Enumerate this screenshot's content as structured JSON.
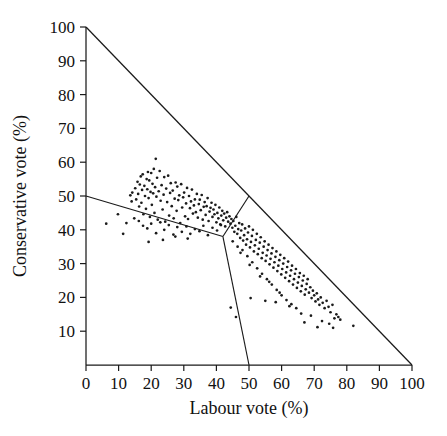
{
  "figure": {
    "background": "#ffffff",
    "ink_color": "#1a1a1a"
  },
  "chart_data": {
    "type": "scatter",
    "title": "",
    "subtitle": "",
    "xlabel": "Labour vote (%)",
    "ylabel": "Conservative vote (%)",
    "xlim": [
      0,
      100
    ],
    "ylim": [
      0,
      100
    ],
    "grid": false,
    "legend": null,
    "xticks": [
      0,
      10,
      20,
      30,
      40,
      50,
      60,
      70,
      80,
      90,
      100
    ],
    "xticklabels": [
      "0",
      "10",
      "20",
      "30",
      "40",
      "50",
      "60",
      "70",
      "80",
      "90",
      "100"
    ],
    "yticks": [
      10,
      20,
      30,
      40,
      50,
      60,
      70,
      80,
      90,
      100
    ],
    "yticklabels": [
      "10",
      "20",
      "30",
      "40",
      "50",
      "60",
      "70",
      "80",
      "90",
      "100"
    ],
    "annotations": [
      {
        "name": "constraint-hypotenuse",
        "description": "Labour + Conservative vote cannot exceed 100%",
        "from": [
          0,
          100
        ],
        "to": [
          100,
          0
        ]
      },
      {
        "name": "partition-left",
        "description": "boundary separating Conservative-win region from the lower-left region",
        "from": [
          0,
          50
        ],
        "to": [
          42,
          38
        ]
      },
      {
        "name": "partition-upper",
        "description": "boundary from junction up to the hypotenuse",
        "from": [
          42,
          38
        ],
        "to": [
          50,
          50
        ]
      },
      {
        "name": "partition-lower",
        "description": "boundary from junction down to the x-axis at Labour = 50",
        "from": [
          42,
          38
        ],
        "to": [
          50,
          0
        ]
      }
    ],
    "series": [
      {
        "name": "constituencies",
        "marker": "dot",
        "color": "#1b1b1b",
        "points": [
          [
            13.6,
            50.2
          ],
          [
            14.2,
            51.0
          ],
          [
            14.0,
            48.4
          ],
          [
            15.1,
            52.3
          ],
          [
            15.4,
            49.0
          ],
          [
            15.8,
            54.2
          ],
          [
            16.0,
            50.6
          ],
          [
            16.3,
            46.9
          ],
          [
            16.5,
            53.4
          ],
          [
            16.8,
            55.8
          ],
          [
            17.0,
            48.0
          ],
          [
            17.2,
            51.8
          ],
          [
            17.4,
            56.4
          ],
          [
            17.6,
            44.6
          ],
          [
            17.9,
            53.0
          ],
          [
            18.1,
            50.0
          ],
          [
            18.4,
            46.2
          ],
          [
            18.6,
            55.0
          ],
          [
            18.8,
            52.0
          ],
          [
            19.0,
            57.1
          ],
          [
            19.2,
            49.4
          ],
          [
            19.4,
            54.6
          ],
          [
            19.6,
            43.8
          ],
          [
            19.8,
            51.2
          ],
          [
            20.0,
            56.8
          ],
          [
            20.2,
            47.4
          ],
          [
            20.4,
            53.6
          ],
          [
            20.6,
            50.8
          ],
          [
            20.8,
            58.0
          ],
          [
            21.0,
            45.0
          ],
          [
            21.2,
            52.6
          ],
          [
            21.4,
            61.0
          ],
          [
            21.6,
            49.8
          ],
          [
            21.8,
            55.4
          ],
          [
            22.0,
            43.0
          ],
          [
            22.3,
            51.4
          ],
          [
            22.6,
            57.4
          ],
          [
            22.9,
            48.6
          ],
          [
            23.2,
            53.2
          ],
          [
            23.5,
            46.0
          ],
          [
            23.8,
            50.4
          ],
          [
            24.0,
            55.6
          ],
          [
            24.3,
            42.4
          ],
          [
            24.6,
            52.2
          ],
          [
            24.9,
            48.2
          ],
          [
            25.2,
            56.0
          ],
          [
            25.5,
            44.2
          ],
          [
            25.8,
            50.9
          ],
          [
            26.0,
            53.8
          ],
          [
            26.3,
            47.0
          ],
          [
            26.6,
            51.6
          ],
          [
            26.9,
            43.4
          ],
          [
            27.2,
            49.2
          ],
          [
            27.5,
            54.0
          ],
          [
            27.8,
            45.6
          ],
          [
            28.0,
            52.8
          ],
          [
            28.3,
            48.8
          ],
          [
            28.6,
            50.2
          ],
          [
            28.9,
            42.0
          ],
          [
            29.2,
            53.5
          ],
          [
            29.5,
            46.6
          ],
          [
            29.8,
            49.6
          ],
          [
            30.1,
            51.0
          ],
          [
            30.4,
            44.0
          ],
          [
            30.7,
            47.8
          ],
          [
            31.0,
            52.4
          ],
          [
            31.3,
            43.2
          ],
          [
            31.6,
            50.0
          ],
          [
            31.9,
            46.4
          ],
          [
            32.2,
            48.4
          ],
          [
            32.5,
            51.9
          ],
          [
            32.8,
            44.8
          ],
          [
            33.1,
            47.2
          ],
          [
            33.4,
            49.0
          ],
          [
            33.7,
            45.2
          ],
          [
            34.0,
            50.6
          ],
          [
            34.3,
            43.6
          ],
          [
            34.6,
            47.6
          ],
          [
            34.9,
            48.9
          ],
          [
            35.2,
            45.8
          ],
          [
            35.5,
            50.3
          ],
          [
            35.8,
            43.0
          ],
          [
            36.1,
            46.8
          ],
          [
            36.4,
            48.2
          ],
          [
            36.7,
            44.4
          ],
          [
            37.0,
            47.0
          ],
          [
            37.3,
            49.4
          ],
          [
            37.6,
            42.6
          ],
          [
            37.9,
            45.4
          ],
          [
            38.2,
            46.5
          ],
          [
            38.5,
            48.0
          ],
          [
            38.8,
            43.8
          ],
          [
            39.1,
            46.0
          ],
          [
            39.4,
            44.6
          ],
          [
            39.7,
            47.4
          ],
          [
            40.0,
            42.2
          ],
          [
            40.3,
            45.0
          ],
          [
            40.6,
            43.4
          ],
          [
            40.9,
            46.6
          ],
          [
            41.2,
            41.6
          ],
          [
            41.5,
            44.2
          ],
          [
            41.8,
            45.6
          ],
          [
            42.1,
            42.8
          ],
          [
            42.4,
            44.8
          ],
          [
            42.7,
            41.0
          ],
          [
            43.0,
            43.6
          ],
          [
            43.3,
            45.2
          ],
          [
            43.6,
            42.4
          ],
          [
            16.2,
            42.6
          ],
          [
            17.5,
            41.2
          ],
          [
            18.8,
            40.4
          ],
          [
            20.0,
            41.8
          ],
          [
            21.5,
            39.0
          ],
          [
            22.8,
            42.2
          ],
          [
            24.0,
            40.0
          ],
          [
            25.4,
            41.4
          ],
          [
            26.8,
            38.6
          ],
          [
            28.0,
            40.8
          ],
          [
            29.4,
            39.4
          ],
          [
            30.8,
            41.0
          ],
          [
            32.0,
            38.8
          ],
          [
            33.4,
            40.2
          ],
          [
            34.8,
            39.6
          ],
          [
            36.0,
            41.2
          ],
          [
            37.4,
            38.4
          ],
          [
            38.8,
            40.6
          ],
          [
            40.2,
            39.8
          ],
          [
            41.4,
            41.4
          ],
          [
            6.2,
            41.8
          ],
          [
            9.8,
            44.6
          ],
          [
            12.4,
            42.0
          ],
          [
            14.8,
            43.4
          ],
          [
            19.2,
            36.4
          ],
          [
            23.6,
            37.0
          ],
          [
            27.4,
            38.0
          ],
          [
            31.2,
            37.4
          ],
          [
            11.4,
            38.8
          ],
          [
            44.0,
            44.0
          ],
          [
            44.3,
            41.8
          ],
          [
            44.6,
            43.2
          ],
          [
            44.9,
            40.6
          ],
          [
            45.2,
            42.6
          ],
          [
            45.5,
            39.4
          ],
          [
            45.8,
            41.2
          ],
          [
            46.1,
            43.8
          ],
          [
            46.4,
            38.8
          ],
          [
            46.7,
            40.2
          ],
          [
            47.0,
            42.0
          ],
          [
            47.3,
            37.6
          ],
          [
            47.6,
            39.8
          ],
          [
            47.9,
            41.6
          ],
          [
            48.2,
            36.8
          ],
          [
            48.5,
            38.4
          ],
          [
            48.8,
            40.4
          ],
          [
            49.1,
            35.6
          ],
          [
            49.4,
            37.2
          ],
          [
            49.7,
            39.2
          ],
          [
            50.0,
            41.0
          ],
          [
            50.3,
            34.8
          ],
          [
            50.6,
            36.4
          ],
          [
            50.9,
            38.2
          ],
          [
            51.2,
            40.0
          ],
          [
            51.5,
            33.6
          ],
          [
            51.8,
            35.4
          ],
          [
            52.1,
            37.0
          ],
          [
            52.4,
            38.8
          ],
          [
            52.7,
            32.8
          ],
          [
            53.0,
            34.4
          ],
          [
            53.3,
            36.2
          ],
          [
            53.6,
            37.8
          ],
          [
            53.9,
            31.6
          ],
          [
            54.2,
            33.2
          ],
          [
            54.5,
            35.0
          ],
          [
            54.8,
            36.6
          ],
          [
            55.1,
            30.8
          ],
          [
            55.4,
            32.4
          ],
          [
            55.7,
            34.0
          ],
          [
            56.0,
            35.6
          ],
          [
            56.3,
            29.8
          ],
          [
            56.6,
            31.4
          ],
          [
            56.9,
            33.0
          ],
          [
            57.2,
            34.6
          ],
          [
            57.5,
            28.8
          ],
          [
            57.8,
            30.4
          ],
          [
            58.1,
            32.0
          ],
          [
            58.4,
            33.6
          ],
          [
            58.7,
            27.8
          ],
          [
            59.0,
            29.4
          ],
          [
            59.3,
            31.0
          ],
          [
            59.6,
            32.6
          ],
          [
            59.9,
            26.8
          ],
          [
            60.2,
            28.4
          ],
          [
            60.5,
            30.0
          ],
          [
            60.8,
            31.6
          ],
          [
            61.1,
            25.8
          ],
          [
            61.4,
            27.4
          ],
          [
            61.7,
            29.0
          ],
          [
            62.0,
            30.6
          ],
          [
            62.3,
            24.8
          ],
          [
            62.6,
            26.4
          ],
          [
            62.9,
            28.0
          ],
          [
            63.2,
            29.4
          ],
          [
            63.5,
            23.8
          ],
          [
            63.8,
            25.4
          ],
          [
            64.1,
            27.0
          ],
          [
            64.4,
            28.4
          ],
          [
            64.7,
            22.8
          ],
          [
            65.0,
            24.4
          ],
          [
            65.3,
            26.0
          ],
          [
            65.6,
            27.2
          ],
          [
            65.9,
            21.8
          ],
          [
            66.2,
            23.4
          ],
          [
            66.5,
            25.0
          ],
          [
            66.8,
            26.4
          ],
          [
            67.1,
            20.8
          ],
          [
            67.4,
            22.4
          ],
          [
            67.7,
            24.0
          ],
          [
            68.0,
            25.4
          ],
          [
            68.4,
            21.4
          ],
          [
            68.8,
            23.0
          ],
          [
            69.2,
            19.8
          ],
          [
            69.6,
            22.0
          ],
          [
            70.0,
            20.6
          ],
          [
            70.4,
            18.8
          ],
          [
            70.8,
            21.2
          ],
          [
            71.2,
            19.4
          ],
          [
            71.6,
            17.8
          ],
          [
            72.0,
            20.0
          ],
          [
            72.6,
            18.4
          ],
          [
            73.2,
            16.8
          ],
          [
            73.8,
            19.0
          ],
          [
            74.4,
            17.2
          ],
          [
            75.0,
            15.6
          ],
          [
            75.6,
            17.8
          ],
          [
            76.2,
            13.8
          ],
          [
            76.8,
            15.0
          ],
          [
            77.4,
            14.2
          ],
          [
            78.0,
            13.4
          ],
          [
            82.0,
            11.6
          ],
          [
            48.0,
            34.0
          ],
          [
            49.5,
            32.2
          ],
          [
            51.0,
            30.4
          ],
          [
            52.5,
            28.6
          ],
          [
            54.0,
            27.0
          ],
          [
            55.5,
            25.4
          ],
          [
            57.0,
            23.8
          ],
          [
            58.5,
            22.2
          ],
          [
            60.0,
            20.6
          ],
          [
            61.5,
            19.2
          ],
          [
            63.0,
            18.0
          ],
          [
            64.5,
            16.8
          ],
          [
            45.0,
            36.6
          ],
          [
            46.5,
            35.0
          ],
          [
            47.4,
            33.2
          ],
          [
            50.2,
            29.6
          ],
          [
            53.4,
            26.2
          ],
          [
            56.2,
            24.6
          ],
          [
            59.4,
            21.4
          ],
          [
            62.4,
            17.4
          ],
          [
            66.0,
            15.2
          ],
          [
            69.0,
            14.6
          ],
          [
            72.4,
            13.0
          ],
          [
            74.6,
            12.2
          ],
          [
            50.5,
            19.8
          ],
          [
            58.2,
            18.6
          ],
          [
            44.4,
            17.0
          ],
          [
            46.0,
            14.2
          ],
          [
            55.0,
            19.0
          ],
          [
            67.0,
            12.6
          ],
          [
            71.0,
            11.2
          ],
          [
            75.8,
            11.0
          ]
        ]
      }
    ]
  }
}
